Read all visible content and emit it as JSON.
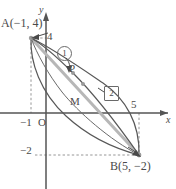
{
  "figure": {
    "axes": {
      "x_axis_label": "x",
      "y_axis_label": "y",
      "origin_label": "O"
    },
    "tick_labels": {
      "x_neg1": "−1",
      "x_5": "5",
      "y_4": "4",
      "y_neg2": "−2"
    },
    "points": [
      {
        "name": "A",
        "label": "A(−1, 4)",
        "x": -1,
        "y": 4
      },
      {
        "name": "B",
        "label": "B(5, −2)",
        "x": 5,
        "y": -2
      },
      {
        "name": "P",
        "label": "P",
        "x": 1,
        "y": 2
      },
      {
        "name": "M",
        "label": "M",
        "x": 2,
        "y": 1
      }
    ],
    "markers": [
      {
        "name": "marker-1",
        "label": "1",
        "shape": "circle"
      },
      {
        "name": "marker-2",
        "label": "2",
        "shape": "square"
      }
    ],
    "colors": {
      "ink": "#4a4a4a",
      "curve": "#585858",
      "segment": "#b0b0b0",
      "axis": "#555555",
      "dashed": "#8a8a8a"
    }
  }
}
